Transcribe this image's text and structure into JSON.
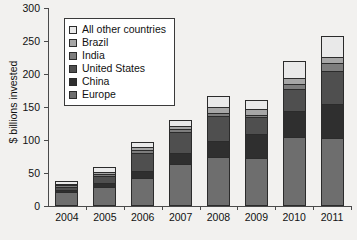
{
  "chart_data": {
    "type": "bar",
    "stacked": true,
    "title": "",
    "xlabel": "",
    "ylabel": "$ billions invested",
    "ylim": [
      0,
      300
    ],
    "yticks": [
      0,
      50,
      100,
      150,
      200,
      250,
      300
    ],
    "grid": false,
    "legend_position": "top-left inside plot",
    "categories": [
      "2004",
      "2005",
      "2006",
      "2007",
      "2008",
      "2009",
      "2010",
      "2011"
    ],
    "series": [
      {
        "name": "Europe",
        "color": "#6e6e6e",
        "values": [
          20,
          27,
          40,
          62,
          73,
          71,
          103,
          101
        ]
      },
      {
        "name": "China",
        "color": "#2f2f2f",
        "values": [
          3,
          6,
          11,
          17,
          25,
          37,
          40,
          52
        ]
      },
      {
        "name": "United States",
        "color": "#4f4f4f",
        "values": [
          6,
          12,
          29,
          33,
          38,
          26,
          34,
          51
        ]
      },
      {
        "name": "India",
        "color": "#7d7d7d",
        "values": [
          2,
          3,
          4,
          5,
          5,
          4,
          8,
          12
        ]
      },
      {
        "name": "Brazil",
        "color": "#a6a6a6",
        "values": [
          2,
          3,
          5,
          4,
          8,
          8,
          8,
          9
        ]
      },
      {
        "name": "All other countries",
        "color": "#e9e9e9",
        "values": [
          5,
          8,
          8,
          9,
          17,
          14,
          26,
          32
        ]
      }
    ],
    "totals": [
      38,
      59,
      97,
      130,
      166,
      160,
      219,
      257
    ]
  },
  "legend": {
    "items": [
      {
        "label": "All other countries"
      },
      {
        "label": "Brazil"
      },
      {
        "label": "India"
      },
      {
        "label": "United States"
      },
      {
        "label": "China"
      },
      {
        "label": "Europe"
      }
    ]
  }
}
